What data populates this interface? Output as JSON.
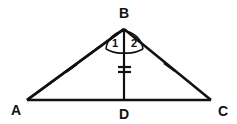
{
  "figure": {
    "type": "geometry-diagram",
    "shape": "triangle-with-cevian",
    "background_color": "#ffffff",
    "stroke_color": "#111111",
    "canvas": {
      "width": 237,
      "height": 124
    }
  },
  "vertices": [
    {
      "id": "A",
      "label": "A",
      "x": 27,
      "y": 100,
      "label_x": 16,
      "label_y": 114
    },
    {
      "id": "B",
      "label": "B",
      "x": 124,
      "y": 29,
      "label_x": 124,
      "label_y": 16
    },
    {
      "id": "C",
      "label": "C",
      "x": 211,
      "y": 100,
      "label_x": 223,
      "label_y": 115
    },
    {
      "id": "D",
      "label": "D",
      "x": 124,
      "y": 100,
      "label_x": 124,
      "label_y": 118
    }
  ],
  "segments": [
    {
      "id": "AB",
      "from": "A",
      "to": "B",
      "x1": 27,
      "y1": 100,
      "x2": 124,
      "y2": 29,
      "ticks": 1
    },
    {
      "id": "BC",
      "from": "B",
      "to": "C",
      "x1": 124,
      "y1": 29,
      "x2": 211,
      "y2": 100,
      "ticks": 1
    },
    {
      "id": "AC",
      "from": "A",
      "to": "C",
      "x1": 27,
      "y1": 100,
      "x2": 211,
      "y2": 100,
      "ticks": 0
    },
    {
      "id": "BD",
      "from": "B",
      "to": "D",
      "x1": 124,
      "y1": 29,
      "x2": 124,
      "y2": 100,
      "ticks": 2
    }
  ],
  "tick_marks": [
    {
      "id": "tick-ab",
      "on_segment": "AB",
      "count": 1,
      "cx": 71,
      "cy": 68
    },
    {
      "id": "tick-bc",
      "on_segment": "BC",
      "count": 1,
      "cx": 169,
      "cy": 67
    },
    {
      "id": "tick-bd-upper",
      "on_segment": "BD",
      "count": 2,
      "cx": 124,
      "cy": 67
    },
    {
      "id": "tick-bd-lower",
      "on_segment": "BD",
      "count": 2,
      "cx": 124,
      "cy": 72
    }
  ],
  "angles": [
    {
      "id": "angle-1",
      "label": "1",
      "vertex": "B",
      "between": [
        "BA",
        "BD"
      ],
      "label_x": 115,
      "label_y": 46,
      "arc_path": "M 107 48 A 20 20 0 0 1 124 29"
    },
    {
      "id": "angle-2",
      "label": "2",
      "vertex": "B",
      "between": [
        "BD",
        "BC"
      ],
      "label_x": 133,
      "label_y": 46,
      "arc_path": "M 124 29 A 21 21 0 0 1 142 48"
    }
  ],
  "angle_arc_base": {
    "path": "M 107 48 Q 124 56 142 48"
  }
}
